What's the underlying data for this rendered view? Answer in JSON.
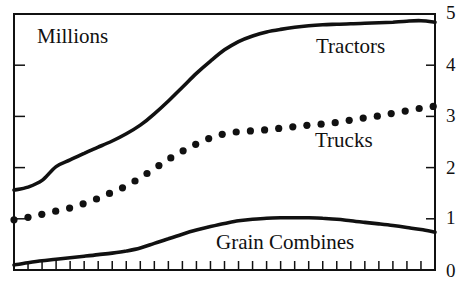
{
  "chart_data": {
    "type": "line",
    "title": "",
    "unit_label": "Millions",
    "xlabel": "",
    "ylabel": "Millions",
    "ylim": [
      0,
      5
    ],
    "y_ticks": [
      0,
      1,
      2,
      3,
      4,
      5
    ],
    "y_axis_position": "right",
    "x_tick_count": 31,
    "x_tick_labels_shown": false,
    "grid": false,
    "legend": "inline labels",
    "x": [
      1,
      2,
      3,
      4,
      5,
      6,
      7,
      8,
      9,
      10,
      11,
      12,
      13,
      14,
      15,
      16,
      17,
      18,
      19,
      20,
      21,
      22,
      23,
      24,
      25,
      26,
      27,
      28,
      29,
      30,
      31
    ],
    "series": [
      {
        "name": "Tractors",
        "style": "solid",
        "values": [
          1.56,
          1.62,
          1.75,
          2.02,
          2.15,
          2.28,
          2.4,
          2.52,
          2.66,
          2.83,
          3.05,
          3.3,
          3.57,
          3.84,
          4.08,
          4.3,
          4.46,
          4.57,
          4.65,
          4.7,
          4.74,
          4.77,
          4.79,
          4.8,
          4.81,
          4.82,
          4.83,
          4.84,
          4.86,
          4.87,
          4.84
        ]
      },
      {
        "name": "Trucks",
        "style": "dotted",
        "values": [
          0.98,
          1.03,
          1.09,
          1.15,
          1.21,
          1.3,
          1.4,
          1.52,
          1.64,
          1.8,
          1.98,
          2.16,
          2.32,
          2.46,
          2.58,
          2.66,
          2.7,
          2.72,
          2.74,
          2.77,
          2.8,
          2.83,
          2.85,
          2.88,
          2.93,
          2.97,
          3.01,
          3.06,
          3.11,
          3.16,
          3.2
        ]
      },
      {
        "name": "Grain Combines",
        "style": "solid",
        "values": [
          0.1,
          0.14,
          0.18,
          0.21,
          0.24,
          0.27,
          0.3,
          0.33,
          0.37,
          0.43,
          0.52,
          0.61,
          0.7,
          0.78,
          0.85,
          0.91,
          0.96,
          0.99,
          1.01,
          1.02,
          1.02,
          1.02,
          1.01,
          0.99,
          0.96,
          0.93,
          0.9,
          0.87,
          0.83,
          0.79,
          0.74
        ]
      }
    ],
    "annotations": [
      {
        "text": "Tractors",
        "series": "Tractors"
      },
      {
        "text": "Trucks",
        "series": "Trucks"
      },
      {
        "text": "Grain Combines",
        "series": "Grain Combines"
      }
    ]
  },
  "labels": {
    "unit": "Millions",
    "tractors": "Tractors",
    "trucks": "Trucks",
    "grain_combines": "Grain Combines",
    "y_ticks": [
      "0",
      "1",
      "2",
      "3",
      "4",
      "5"
    ]
  },
  "colors": {
    "ink": "#111111",
    "background": "#ffffff"
  }
}
